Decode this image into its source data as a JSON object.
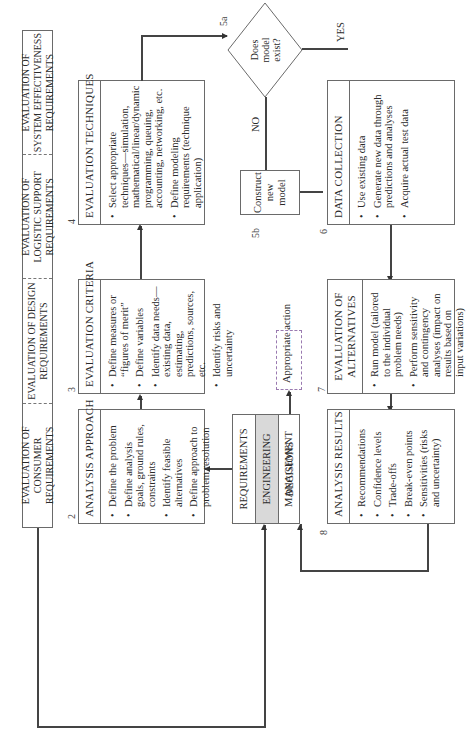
{
  "requirements_band": [
    "EVALUATION OF CONSUMER REQUIREMENTS",
    "EVALUATION OF DESIGN REQUIREMENTS",
    "EVALUATION OF LOGISTIC SUPPORT REQUIREMENTS",
    "EVALUATION OF SYSTEM EFFECTIVENESS REQUIREMENTS"
  ],
  "center_box": {
    "number": "1",
    "rows": [
      "REQUIREMENTS",
      "ENGINEERING MANAGEMENT",
      "DECISIONS"
    ]
  },
  "boxes": {
    "analysis_approach": {
      "number": "2",
      "title": "ANALYSIS APPROACH",
      "items": [
        "Define the problem",
        "Define analysis goals, ground rules, constraints",
        "Identify feasible alternatives",
        "Define approach to problem resolution"
      ]
    },
    "evaluation_criteria": {
      "number": "3",
      "title": "EVALUATION CRITERIA",
      "items": [
        "Define measures or “figures of merit”",
        "Define variables",
        "Identify data needs—existing data, estimating, predictions, sources, etc.",
        "Identify risks and uncertainty"
      ]
    },
    "evaluation_techniques": {
      "number": "4",
      "title": "EVALUATION TECHNIQUES",
      "items": [
        "Select appropriate techniques—simulation, mathematical/linear/dynamic programming, queuing, accounting, networking, etc.",
        "Define modeling requirements (technique application)"
      ]
    },
    "data_collection": {
      "number": "6",
      "title": "DATA  COLLECTION",
      "items": [
        "Use existing data",
        "Generate new data through predictions and analyses",
        "Acquire actual test data"
      ]
    },
    "evaluation_of_alternatives": {
      "number": "7",
      "title": "EVALUATION OF ALTERNATIVES",
      "items": [
        "Run model (tailored to the individual problem needs)",
        "Perform sensitivity and contingency analyses (impact on results based on input variations)"
      ]
    },
    "analysis_results": {
      "number": "8",
      "title": "ANALYSIS RESULTS",
      "items": [
        "Recommendations",
        "Confidence levels",
        "Trade-offs",
        "Break-even points",
        "Sensitivities (risks and uncertainty)"
      ]
    }
  },
  "decision": {
    "number": "5a",
    "text": "Does model exist?",
    "yes_label": "YES",
    "no_label": "NO"
  },
  "construct_model": {
    "number": "5b",
    "text": "Construct new model"
  },
  "appropriate_action": {
    "text": "Appropriate action"
  }
}
